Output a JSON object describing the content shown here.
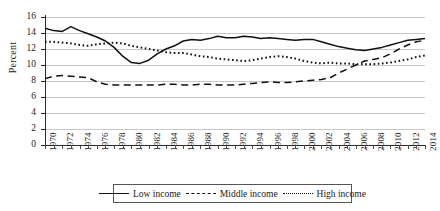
{
  "chart_data": {
    "type": "line",
    "title": "",
    "xlabel": "",
    "ylabel": "Percent",
    "ylim": [
      0,
      16
    ],
    "yticks": [
      0,
      2,
      4,
      6,
      8,
      10,
      12,
      14,
      16
    ],
    "xlim": [
      1970,
      2014
    ],
    "grid": true,
    "legend_position": "bottom",
    "x": [
      1970,
      1971,
      1972,
      1973,
      1974,
      1975,
      1976,
      1977,
      1978,
      1979,
      1980,
      1981,
      1982,
      1983,
      1984,
      1985,
      1986,
      1987,
      1988,
      1989,
      1990,
      1991,
      1992,
      1993,
      1994,
      1995,
      1996,
      1997,
      1998,
      1999,
      2000,
      2001,
      2002,
      2003,
      2004,
      2005,
      2006,
      2007,
      2008,
      2009,
      2010,
      2011,
      2012,
      2013,
      2014
    ],
    "xtick_labels": [
      "1970",
      "1972",
      "1974",
      "1976",
      "1978",
      "1980",
      "1982",
      "1984",
      "1986",
      "1988",
      "1990",
      "1992",
      "1994",
      "1996",
      "1998",
      "2000",
      "2002",
      "2004",
      "2006",
      "2008",
      "2010",
      "2012",
      "2014"
    ],
    "series": [
      {
        "name": "Low income",
        "style": "solid",
        "values": [
          14.6,
          14.3,
          14.2,
          14.8,
          14.3,
          13.9,
          13.5,
          13.0,
          12.2,
          11.1,
          10.3,
          10.2,
          10.6,
          11.4,
          12.0,
          12.4,
          13.0,
          13.2,
          13.1,
          13.3,
          13.6,
          13.4,
          13.4,
          13.6,
          13.5,
          13.3,
          13.4,
          13.3,
          13.2,
          13.1,
          13.2,
          13.2,
          12.9,
          12.6,
          12.3,
          12.1,
          11.9,
          11.8,
          12.0,
          12.2,
          12.5,
          12.8,
          13.1,
          13.2,
          13.3
        ]
      },
      {
        "name": "Middle income",
        "style": "dashed",
        "values": [
          8.3,
          8.6,
          8.7,
          8.6,
          8.5,
          8.4,
          7.9,
          7.6,
          7.5,
          7.5,
          7.5,
          7.5,
          7.5,
          7.5,
          7.6,
          7.6,
          7.5,
          7.5,
          7.6,
          7.6,
          7.5,
          7.5,
          7.5,
          7.6,
          7.7,
          7.8,
          7.9,
          7.8,
          7.8,
          7.9,
          8.0,
          8.1,
          8.2,
          8.4,
          9.0,
          9.5,
          10.0,
          10.5,
          10.7,
          10.9,
          11.4,
          12.0,
          12.5,
          12.9,
          13.1
        ]
      },
      {
        "name": "High income",
        "style": "dotted",
        "values": [
          12.9,
          12.9,
          12.8,
          12.7,
          12.5,
          12.4,
          12.6,
          12.7,
          12.8,
          12.7,
          12.4,
          12.2,
          12.0,
          11.8,
          11.6,
          11.5,
          11.5,
          11.3,
          11.1,
          11.0,
          10.8,
          10.7,
          10.6,
          10.5,
          10.6,
          10.8,
          11.0,
          11.1,
          11.0,
          10.8,
          10.5,
          10.3,
          10.2,
          10.3,
          10.2,
          10.2,
          10.1,
          10.1,
          10.1,
          10.2,
          10.3,
          10.5,
          10.7,
          11.0,
          11.2
        ]
      }
    ]
  },
  "legend": {
    "items": [
      {
        "label": "Low income",
        "style": "solid"
      },
      {
        "label": "Middle income",
        "style": "dashed"
      },
      {
        "label": "High income",
        "style": "dotted"
      }
    ]
  }
}
